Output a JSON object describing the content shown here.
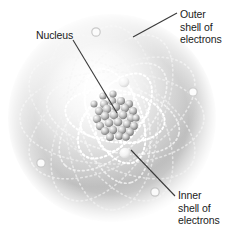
{
  "figure": {
    "background_color": "#ffffff"
  },
  "labels": {
    "nucleus": {
      "text": "Nucleus",
      "name": "nucleus-label"
    },
    "outer_shell": {
      "text": "Outer\nshell of\nelectrons",
      "name": "outer-shell-label"
    },
    "inner_shell": {
      "text": "Inner\nshell of\nelectrons",
      "name": "inner-shell-label"
    }
  },
  "colors": {
    "text": "#1b1b1b",
    "leader_line": "#3a3a3a",
    "sphere_mid": "#b9b9b9",
    "sphere_edge": "#ffffff",
    "orbit_inner": "#ffffff",
    "orbit_outer": "#dedede",
    "electron_inner_fill": "#f2f2f2",
    "electron_outer_stroke": "#cfcfcf",
    "nucleon_light": "#f0f0f0",
    "nucleon_dark": "#8a8a8a"
  },
  "diagram": {
    "sphere": {
      "cx": 112,
      "cy": 118,
      "r": 104
    },
    "nucleus": {
      "cx": 116,
      "cy": 116,
      "r": 20,
      "nucleon_count": 30
    },
    "inner_orbit_electrons": [
      {
        "cx": 124,
        "cy": 82,
        "r": 5.2
      },
      {
        "cx": 125,
        "cy": 153,
        "r": 5.2
      }
    ],
    "outer_orbit_electrons": [
      {
        "cx": 96,
        "cy": 32,
        "r": 4.2
      },
      {
        "cx": 193,
        "cy": 92,
        "r": 4.2
      },
      {
        "cx": 41,
        "cy": 163,
        "r": 4.2
      },
      {
        "cx": 155,
        "cy": 192,
        "r": 4.2
      }
    ],
    "leader_lines": [
      {
        "name": "nucleus-leader",
        "x1": 73,
        "y1": 40,
        "x2": 116,
        "y2": 113
      },
      {
        "name": "outer-shell-leader",
        "x1": 133,
        "y1": 37,
        "x2": 177,
        "y2": 13
      },
      {
        "name": "inner-shell-leader",
        "x1": 132,
        "y1": 151,
        "x2": 175,
        "y2": 196
      }
    ],
    "orbit_rotations_outer": [
      0,
      30,
      60,
      90,
      120,
      150
    ],
    "orbit_rotations_inner": [
      15,
      75,
      135
    ]
  }
}
